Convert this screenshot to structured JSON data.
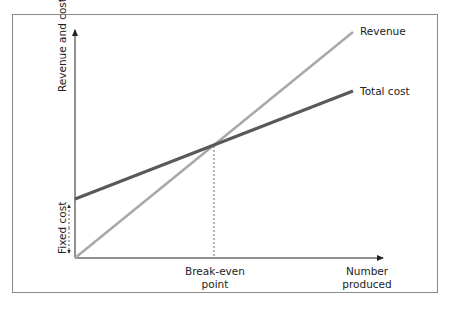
{
  "diagram": {
    "y_axis_label": "Revenue and costs",
    "x_axis_label_line1": "Number",
    "x_axis_label_line2": "produced",
    "fixed_cost_label": "Fixed cost",
    "break_even_line1": "Break-even",
    "break_even_line2": "point",
    "series": [
      {
        "name": "Revenue",
        "color": "#a8a8a8",
        "start": [
          0,
          0
        ],
        "end": [
          1,
          1
        ]
      },
      {
        "name": "Total cost",
        "color": "#595959",
        "start": [
          0,
          0.26
        ],
        "end": [
          1,
          0.74
        ]
      }
    ],
    "colors": {
      "frame": "#8a8a8a",
      "axes": "#222222",
      "revenue": "#a8a8a8",
      "total_cost": "#595959"
    }
  }
}
